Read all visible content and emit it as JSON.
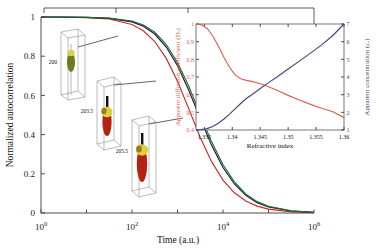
{
  "figure": {
    "name": "normalized-autocorrelation-vs-time",
    "background": "#ffffff"
  },
  "main_axes": {
    "ylabel": "Normalized autocorrelation",
    "xlabel": "Time (a.u.)",
    "yticks": [
      "0",
      "0.2",
      "0.4",
      "0.6",
      "0.8",
      "1"
    ],
    "ytick_values": [
      0,
      0.2,
      0.4,
      0.6,
      0.8,
      1
    ],
    "xticks": [
      "10",
      "10",
      "10",
      "10"
    ],
    "xtick_exponents": [
      "0",
      "2",
      "4",
      "6"
    ],
    "xtick_values": [
      0,
      2,
      4,
      6
    ]
  },
  "annotations": {
    "cuvette_labels": [
      "200",
      "203.5",
      "205.5"
    ],
    "bracket_label": ""
  },
  "inset_axes": {
    "xlabel": "Refractive index",
    "ylabel_left": "Apparent diffusion coefficient (Dₐ)",
    "ylabel_right": "Apparent concentration (cₐ)",
    "xticks": [
      "1.335",
      "1.34",
      "1.345",
      "1.35",
      "1.355",
      "1.36"
    ],
    "xtick_values": [
      1.335,
      1.34,
      1.345,
      1.35,
      1.355,
      1.36
    ],
    "left_yticks": [
      "0.4",
      "0.5",
      "0.6",
      "0.7",
      "0.8",
      "0.9",
      "1"
    ],
    "left_ytick_values": [
      0.4,
      0.5,
      0.6,
      0.7,
      0.8,
      0.9,
      1
    ],
    "right_yticks": [
      "1",
      "2",
      "3",
      "4",
      "5",
      "6",
      "7"
    ],
    "right_ytick_values": [
      1,
      2,
      3,
      4,
      5,
      6,
      7
    ]
  },
  "colors": {
    "curve_red": "#d62728",
    "curve_black": "#1a1a2e",
    "curve_green": "#1f6b3a",
    "inset_red": "#e06050",
    "inset_blue": "#3f4878",
    "axis": "#4d4d4d"
  },
  "chart_data": [
    {
      "type": "line",
      "id": "main-autocorrelation",
      "title": "",
      "xlabel": "Time (a.u.)",
      "ylabel": "Normalized autocorrelation",
      "xscale": "log",
      "xlim": [
        1,
        1000000
      ],
      "ylim": [
        0,
        1
      ],
      "grid": false,
      "legend": "none",
      "x": [
        1,
        3.16,
        10,
        31.6,
        100,
        178,
        316,
        562,
        1000,
        1780,
        3160,
        5620,
        10000,
        17800,
        31600,
        56200,
        100000,
        316000,
        1000000
      ],
      "series": [
        {
          "name": "curve-red",
          "color": "#d62728",
          "values": [
            1.0,
            0.999,
            0.997,
            0.99,
            0.962,
            0.93,
            0.875,
            0.79,
            0.672,
            0.53,
            0.385,
            0.262,
            0.168,
            0.103,
            0.061,
            0.035,
            0.02,
            0.006,
            0.002
          ]
        },
        {
          "name": "curve-black",
          "color": "#1a1a2e",
          "values": [
            1.0,
            0.9995,
            0.998,
            0.993,
            0.975,
            0.953,
            0.913,
            0.848,
            0.752,
            0.625,
            0.482,
            0.345,
            0.232,
            0.148,
            0.09,
            0.053,
            0.031,
            0.01,
            0.003
          ]
        },
        {
          "name": "curve-green",
          "color": "#1f6b3a",
          "values": [
            1.0,
            0.9996,
            0.9985,
            0.9945,
            0.979,
            0.959,
            0.922,
            0.861,
            0.768,
            0.645,
            0.502,
            0.363,
            0.246,
            0.159,
            0.097,
            0.058,
            0.034,
            0.011,
            0.0035
          ]
        }
      ]
    },
    {
      "type": "line",
      "id": "inset-refractive-index",
      "title": "",
      "xlabel": "Refractive index",
      "ylabel": "Apparent diffusion coefficient (Dₐ)",
      "ylabel2": "Apparent concentration (cₐ)",
      "xlim": [
        1.3335,
        1.36
      ],
      "ylim": [
        0.4,
        1.0
      ],
      "ylim2": [
        1,
        7
      ],
      "grid": false,
      "legend": "none",
      "x": [
        1.3335,
        1.3345,
        1.3355,
        1.3365,
        1.3375,
        1.3385,
        1.3395,
        1.3405,
        1.3415,
        1.3425,
        1.3435,
        1.345,
        1.3465,
        1.348,
        1.35,
        1.352,
        1.354,
        1.356,
        1.358,
        1.36
      ],
      "series": [
        {
          "name": "apparent-diffusion-coefficient",
          "color": "#e06050",
          "axis": "left",
          "values": [
            1.0,
            0.995,
            0.975,
            0.932,
            0.875,
            0.812,
            0.755,
            0.712,
            0.69,
            0.681,
            0.675,
            0.662,
            0.645,
            0.625,
            0.596,
            0.57,
            0.545,
            0.523,
            0.503,
            0.47
          ]
        },
        {
          "name": "apparent-concentration",
          "color": "#3f4878",
          "axis": "right",
          "values": [
            1.0,
            1.02,
            1.08,
            1.2,
            1.38,
            1.62,
            1.9,
            2.2,
            2.5,
            2.78,
            3.0,
            3.35,
            3.68,
            4.0,
            4.45,
            4.9,
            5.35,
            5.82,
            6.35,
            7.0
          ]
        }
      ]
    }
  ]
}
